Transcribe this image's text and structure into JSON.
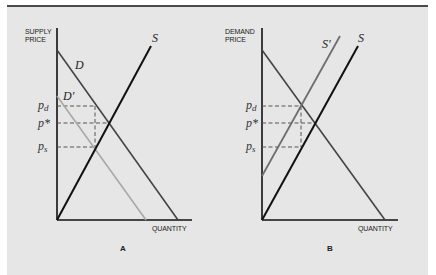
{
  "figure": {
    "background": "#e6e6e6",
    "border_color": "#4a4a4a"
  },
  "panels": [
    {
      "id": "A",
      "letter": "A",
      "y_axis_label_line1": "SUPPLY",
      "y_axis_label_line2": "PRICE",
      "x_axis_label": "QUANTITY",
      "curves": {
        "D": "D",
        "D_prime": "D'",
        "S": "S"
      },
      "price_labels": {
        "p_d": "p",
        "p_d_sub": "d",
        "p_star": "p*",
        "p_s": "p",
        "p_s_sub": "s"
      }
    },
    {
      "id": "B",
      "letter": "B",
      "y_axis_label_line1": "DEMAND",
      "y_axis_label_line2": "PRICE",
      "x_axis_label": "QUANTITY",
      "curves": {
        "S": "S",
        "S_prime": "S'"
      },
      "price_labels": {
        "p_d": "p",
        "p_d_sub": "d",
        "p_star": "p*",
        "p_s": "p",
        "p_s_sub": "s"
      }
    }
  ],
  "colors": {
    "original_curve": "#111111",
    "demand_curve": "#444444",
    "shifted_demand": "#a8a8a8",
    "shifted_supply": "#6e6e6e"
  }
}
